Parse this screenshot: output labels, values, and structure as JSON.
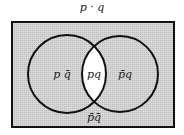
{
  "title": "p · q",
  "regions": {
    "left_only": "p q̄",
    "intersection": "pq",
    "right_only": "p̄q",
    "outside": "p̄q̄"
  },
  "colors": {
    "shading": "#cfcfcf",
    "highlight": "#ffffff",
    "stroke": "#111111"
  }
}
